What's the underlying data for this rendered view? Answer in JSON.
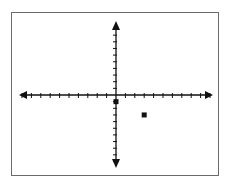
{
  "chart_data": {
    "type": "scatter",
    "title": "",
    "xlabel": "",
    "ylabel": "",
    "xlim": [
      -10,
      10
    ],
    "ylim": [
      -10,
      10
    ],
    "grid": false,
    "x_tick_step": 1,
    "y_tick_step": 1,
    "points": [
      {
        "x": 0,
        "y": -1,
        "marker": "dot"
      },
      {
        "x": 3,
        "y": -3,
        "marker": "square"
      }
    ]
  },
  "colors": {
    "axis": "#111111",
    "frame": "#6b6b6b",
    "point": "#111111"
  }
}
